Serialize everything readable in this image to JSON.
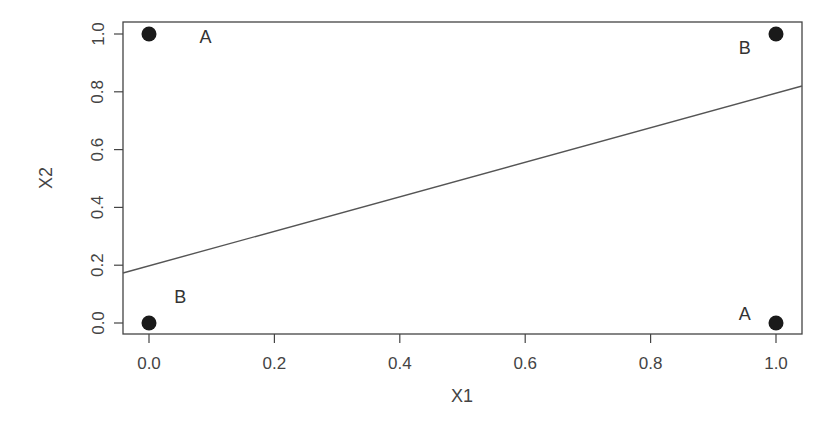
{
  "chart_data": {
    "type": "scatter",
    "title": "",
    "xlabel": "X1",
    "ylabel": "X2",
    "xlim": [
      -0.04,
      1.04
    ],
    "ylim": [
      -0.04,
      1.04
    ],
    "xticks": [
      "0.0",
      "0.2",
      "0.4",
      "0.6",
      "0.8",
      "1.0"
    ],
    "yticks": [
      "0.0",
      "0.2",
      "0.4",
      "0.6",
      "0.8",
      "1.0"
    ],
    "grid": false,
    "legend": null,
    "points": [
      {
        "x": 0,
        "y": 1,
        "class": "A"
      },
      {
        "x": 1,
        "y": 1,
        "class": "B"
      },
      {
        "x": 0,
        "y": 0,
        "class": "B"
      },
      {
        "x": 1,
        "y": 0,
        "class": "A"
      }
    ],
    "annotations": [
      {
        "text": "A",
        "x": 0.09,
        "y": 0.99
      },
      {
        "text": "B",
        "x": 0.95,
        "y": 0.95
      },
      {
        "text": "B",
        "x": 0.05,
        "y": 0.09
      },
      {
        "text": "A",
        "x": 0.95,
        "y": 0.03
      }
    ],
    "line": {
      "x": [
        -0.04,
        1.04
      ],
      "y": [
        0.18,
        0.82
      ],
      "description": "decision boundary"
    }
  }
}
